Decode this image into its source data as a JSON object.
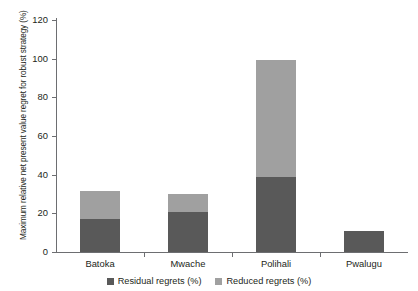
{
  "chart_data": {
    "type": "bar",
    "stacked": true,
    "title": "",
    "xlabel": "",
    "ylabel": "Maximum relative net present value regret for robust strategy (%)",
    "categories": [
      "Batoka",
      "Mwache",
      "Polihali",
      "Pwalugu"
    ],
    "series": [
      {
        "name": "Residual regrets (%)",
        "color": "#595959",
        "values": [
          17,
          20.5,
          39,
          11
        ]
      },
      {
        "name": "Reduced regrets (%)",
        "color": "#a0a0a0",
        "values": [
          14.5,
          9.5,
          60.5,
          0
        ]
      }
    ],
    "totals": [
      31.5,
      30,
      99.5,
      11
    ],
    "ylim": [
      0,
      120
    ],
    "yticks": [
      0,
      20,
      40,
      60,
      80,
      100,
      120
    ],
    "ytick_labels": [
      "0",
      "20",
      "40",
      "60",
      "80",
      "100",
      "120"
    ],
    "grid": false,
    "legend_position": "bottom"
  },
  "legend": {
    "items": [
      {
        "label": "Residual regrets (%)",
        "color": "#595959"
      },
      {
        "label": "Reduced regrets (%)",
        "color": "#a0a0a0"
      }
    ]
  },
  "axis": {
    "y_title": "Maximum relative net present value regret for robust strategy (%)"
  }
}
